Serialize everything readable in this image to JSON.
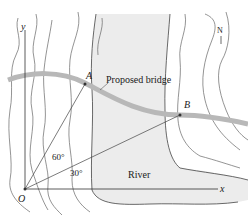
{
  "diagram": {
    "labels": {
      "y_axis": "y",
      "x_axis": "x",
      "origin": "O",
      "point_a": "A",
      "point_b": "B",
      "bridge": "Proposed bridge",
      "river": "River",
      "angle_a": "60°",
      "angle_b": "30°",
      "north": "N"
    },
    "colors": {
      "river_fill": "#ececec",
      "bridge": "#b8b8b8",
      "contour": "#555555",
      "axis": "#333333"
    }
  }
}
